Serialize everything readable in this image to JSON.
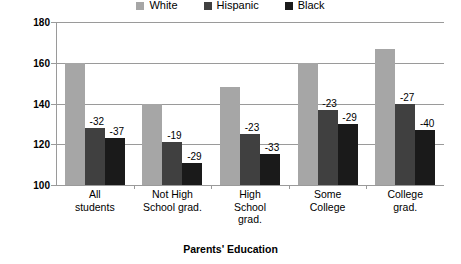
{
  "chart_data": {
    "type": "bar",
    "title": "",
    "xlabel": "Parents' Education",
    "ylabel": "",
    "ylim": [
      100,
      180
    ],
    "yticks": [
      100,
      120,
      140,
      160,
      180
    ],
    "grid": true,
    "legend_position": "top-center",
    "categories": [
      "All\nstudents",
      "Not High\nSchool grad.",
      "High\nSchool\ngrad.",
      "Some\nCollege",
      "College\ngrad."
    ],
    "series": [
      {
        "name": "White",
        "color": "#a6a6a6",
        "values": [
          160,
          140,
          148,
          160,
          167
        ]
      },
      {
        "name": "Hispanic",
        "color": "#404040",
        "values": [
          128,
          121,
          125,
          137,
          140
        ]
      },
      {
        "name": "Black",
        "color": "#1a1a1a",
        "values": [
          123,
          111,
          115,
          130,
          127
        ]
      }
    ],
    "annotations": [
      {
        "group": 0,
        "series": "Hispanic",
        "text": "-32"
      },
      {
        "group": 0,
        "series": "Black",
        "text": "-37"
      },
      {
        "group": 1,
        "series": "Hispanic",
        "text": "-19"
      },
      {
        "group": 1,
        "series": "Black",
        "text": "-29"
      },
      {
        "group": 2,
        "series": "Hispanic",
        "text": "-23"
      },
      {
        "group": 2,
        "series": "Black",
        "text": "-33"
      },
      {
        "group": 3,
        "series": "Hispanic",
        "text": "-23"
      },
      {
        "group": 3,
        "series": "Black",
        "text": "-29"
      },
      {
        "group": 4,
        "series": "Hispanic",
        "text": "-27"
      },
      {
        "group": 4,
        "series": "Black",
        "text": "-40"
      }
    ]
  },
  "legend": {
    "items": [
      {
        "label": "White"
      },
      {
        "label": "Hispanic"
      },
      {
        "label": "Black"
      }
    ]
  },
  "axis": {
    "x_title": "Parents' Education"
  }
}
